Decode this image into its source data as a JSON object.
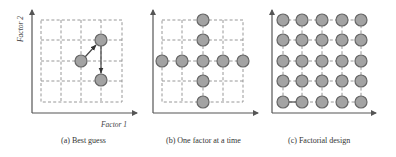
{
  "figure": {
    "panels": [
      {
        "id": "a",
        "caption": "(a) Best guess",
        "points": [
          [
            81,
            61
          ],
          [
            101,
            40
          ],
          [
            101,
            80
          ]
        ],
        "arrows": [
          [
            [
              81,
              61
            ],
            [
              101,
              40
            ]
          ],
          [
            [
              101,
              40
            ],
            [
              101,
              80
            ]
          ]
        ]
      },
      {
        "id": "b",
        "caption": "(b) One factor at a time",
        "points": [
          [
            203,
            20
          ],
          [
            203,
            40
          ],
          [
            162,
            61
          ],
          [
            182,
            61
          ],
          [
            203,
            61
          ],
          [
            223,
            61
          ],
          [
            243,
            61
          ],
          [
            203,
            81
          ],
          [
            203,
            102
          ]
        ]
      },
      {
        "id": "c",
        "caption": "(c) Factorial design",
        "grid_points": "5x5"
      }
    ],
    "axis_labels": {
      "x": "Factor 1",
      "y": "Factor 2"
    },
    "colors": {
      "point_fill": "#a3a3a3",
      "point_stroke": "#666666",
      "grid": "#8c8c8c",
      "axis": "#555555"
    }
  }
}
